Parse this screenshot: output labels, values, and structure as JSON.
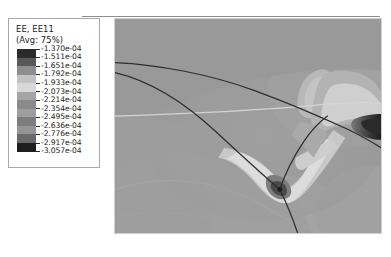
{
  "window": {
    "title": "EE, EE11 contour plot"
  },
  "legend": {
    "variable_label": "EE, EE11",
    "average_label": "(Avg: 75%)",
    "values": [
      "-1.370e-04",
      "-1.511e-04",
      "-1.651e-04",
      "-1.792e-04",
      "-1.933e-04",
      "-2.073e-04",
      "-2.214e-04",
      "-2.354e-04",
      "-2.495e-04",
      "-2.636e-04",
      "-2.776e-04",
      "-2.917e-04",
      "-3.057e-04"
    ],
    "swatch_colors": [
      "#2b2b2b",
      "#585858",
      "#8e8e8e",
      "#c2c2c2",
      "#d8d8d8",
      "#a5a5a5",
      "#8a8a8a",
      "#9e9e9e",
      "#7d7d7d",
      "#949494",
      "#6a6a6a",
      "#1e1e1e"
    ]
  },
  "chart_data": {
    "type": "heatmap",
    "title": "EE, EE11",
    "subtitle": "(Avg: 75%)",
    "xlabel": "",
    "ylabel": "",
    "colormap": "grayscale",
    "legend_position": "left",
    "grid": false,
    "contour_levels": [
      -0.000137,
      -0.0001511,
      -0.0001651,
      -0.0001792,
      -0.0001933,
      -0.0002073,
      -0.0002214,
      -0.0002354,
      -0.0002495,
      -0.0002636,
      -0.0002776,
      -0.0002917,
      -0.0003057
    ],
    "value_min": -0.0003057,
    "value_max": -0.000137,
    "units": "strain",
    "field_description": "Logarithmic strain component EE11 over a wedge/indentation region with two intersecting crack fronts",
    "features": [
      {
        "name": "upper-crack-curve",
        "type": "curve",
        "color": "#303030"
      },
      {
        "name": "lower-crack-curve",
        "type": "curve",
        "color": "#303030"
      },
      {
        "name": "vertical-crack-branch",
        "type": "curve",
        "color": "#303030"
      },
      {
        "name": "triple-junction",
        "type": "point",
        "x": 0.53,
        "y": 0.69
      },
      {
        "name": "bright-V-band",
        "type": "region",
        "value": -0.000193
      },
      {
        "name": "right-dark-band",
        "type": "region",
        "value": -0.000306
      },
      {
        "name": "light-horizontal-streak",
        "type": "line",
        "color": "#d5d5d5"
      }
    ]
  }
}
